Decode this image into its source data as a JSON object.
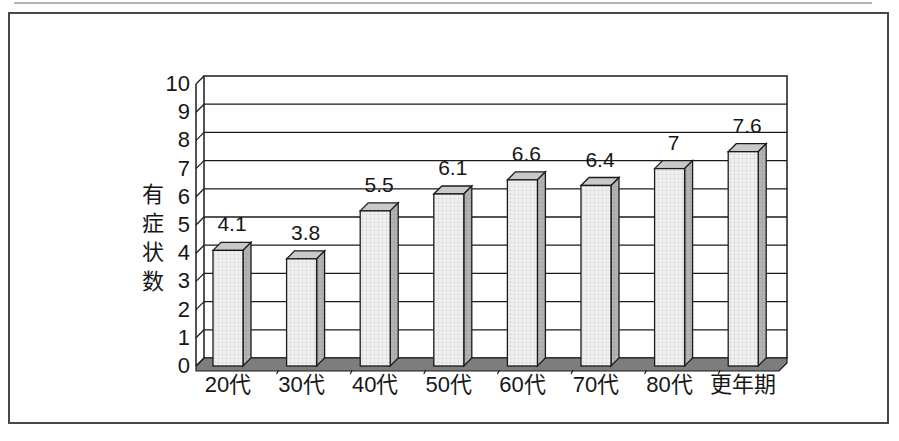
{
  "chart_data": {
    "type": "bar",
    "style": "3d-column",
    "title": "",
    "xlabel": "",
    "ylabel": "有症状数",
    "categories": [
      "20代",
      "30代",
      "40代",
      "50代",
      "60代",
      "70代",
      "80代",
      "更年期"
    ],
    "values": [
      4.1,
      3.8,
      5.5,
      6.1,
      6.6,
      6.4,
      7,
      7.6
    ],
    "value_labels": [
      "4.1",
      "3.8",
      "5.5",
      "6.1",
      "6.6",
      "6.4",
      "7",
      "7.6"
    ],
    "ylim": [
      0,
      10
    ],
    "y_tick_labels": [
      "0",
      "1",
      "2",
      "3",
      "4",
      "5",
      "6",
      "7",
      "8",
      "9",
      "10"
    ],
    "grid": true,
    "legend": "none",
    "colors": {
      "line": "#1b1b1b",
      "wall_fill": "#ffffff",
      "bar_front": "#f0f0f0",
      "bar_front_grid": "#d6d6d6",
      "bar_side": "#b4b4b4",
      "bar_side_grid": "#9f9f9f",
      "bar_top": "#c9c9c9",
      "floor": "#7d7d7d",
      "text": "#161616",
      "frame_border": "#474747"
    }
  }
}
